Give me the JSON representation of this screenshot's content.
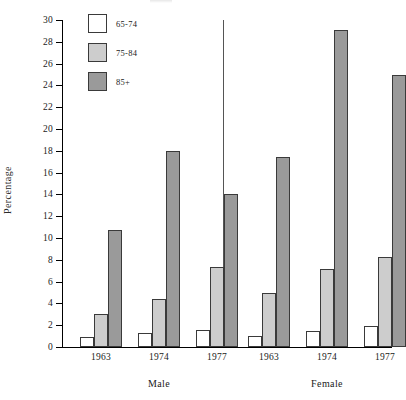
{
  "chart_data": {
    "type": "bar",
    "title": "",
    "xlabel": "",
    "ylabel": "Percentage",
    "ylim": [
      0,
      30
    ],
    "ytick_step": 2,
    "yticks": [
      0,
      2,
      4,
      6,
      8,
      10,
      12,
      14,
      16,
      18,
      20,
      22,
      24,
      26,
      28,
      30
    ],
    "grid": false,
    "legend_position": "top-left",
    "panel_divider": true,
    "panels": [
      "Male",
      "Female"
    ],
    "categories": [
      "1963",
      "1974",
      "1977"
    ],
    "series": [
      {
        "name": "65-74",
        "color": "#ffffff",
        "values_male": [
          0.9,
          1.3,
          1.6
        ],
        "values_female": [
          1.0,
          1.5,
          1.9
        ]
      },
      {
        "name": "75-84",
        "color": "#cdcdcd",
        "values_male": [
          3.0,
          4.4,
          7.3
        ],
        "values_female": [
          5.0,
          7.2,
          8.3
        ]
      },
      {
        "name": "85+",
        "color": "#9a9a9a",
        "values_male": [
          10.7,
          18.0,
          14.0
        ],
        "values_female": [
          17.4,
          29.1,
          25.0
        ]
      }
    ],
    "groups": [
      {
        "panel": "Male",
        "category": "1963",
        "bars": [
          {
            "series": "65-74",
            "value": 0.9
          },
          {
            "series": "75-84",
            "value": 3.0
          },
          {
            "series": "85+",
            "value": 10.7
          }
        ]
      },
      {
        "panel": "Male",
        "category": "1974",
        "bars": [
          {
            "series": "65-74",
            "value": 1.3
          },
          {
            "series": "75-84",
            "value": 4.4
          },
          {
            "series": "85+",
            "value": 18.0
          }
        ]
      },
      {
        "panel": "Male",
        "category": "1977",
        "bars": [
          {
            "series": "65-74",
            "value": 1.6
          },
          {
            "series": "75-84",
            "value": 7.3
          },
          {
            "series": "85+",
            "value": 14.0
          }
        ]
      },
      {
        "panel": "Female",
        "category": "1963",
        "bars": [
          {
            "series": "65-74",
            "value": 1.0
          },
          {
            "series": "75-84",
            "value": 5.0
          },
          {
            "series": "85+",
            "value": 17.4
          }
        ]
      },
      {
        "panel": "Female",
        "category": "1974",
        "bars": [
          {
            "series": "65-74",
            "value": 1.5
          },
          {
            "series": "75-84",
            "value": 7.2
          },
          {
            "series": "85+",
            "value": 29.1
          }
        ]
      },
      {
        "panel": "Female",
        "category": "1977",
        "bars": [
          {
            "series": "65-74",
            "value": 1.9
          },
          {
            "series": "75-84",
            "value": 8.3
          },
          {
            "series": "85+",
            "value": 25.0
          }
        ]
      }
    ]
  },
  "legend": {
    "items": [
      {
        "label": "65-74",
        "color": "#ffffff"
      },
      {
        "label": "75-84",
        "color": "#cdcdcd"
      },
      {
        "label": "85+",
        "color": "#9a9a9a"
      }
    ]
  },
  "axis": {
    "y_title": "Percentage"
  }
}
